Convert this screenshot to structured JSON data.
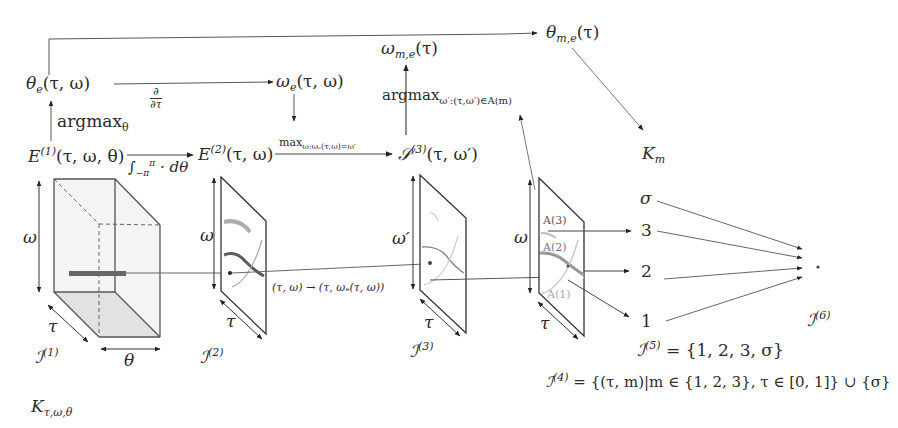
{
  "diagram": {
    "nodes": {
      "theta_e": "θ",
      "theta_e_sub": "e",
      "theta_e_args": "(τ, ω)",
      "omega_e": "ω",
      "omega_e_sub": "e",
      "omega_e_args": "(τ, ω)",
      "omega_me": "ω",
      "omega_me_sub": "m,e",
      "omega_me_args": "(τ)",
      "theta_me": "θ",
      "theta_me_sub": "m,e",
      "theta_me_args": "(τ)",
      "E1": "E",
      "E1_sup": "(1)",
      "E1_args": "(τ, ω, θ)",
      "E2": "E",
      "E2_sup": "(2)",
      "E2_args": "(τ, ω)",
      "S3": "𝒮",
      "S3_sup": "(3)",
      "S3_args": "(τ, ω′)",
      "K_m": "K",
      "K_m_sub": "m",
      "K_tow": "K",
      "K_tow_sub": "τ,ω,θ"
    },
    "edge_labels": {
      "argmax_theta": "argmax",
      "argmax_theta_sub": "θ",
      "d_dtau_num": "∂",
      "d_dtau_den": "∂τ",
      "integral": "∫",
      "integral_sup": "π",
      "integral_sub": "−π",
      "integral_body": "· dθ",
      "max_label": "max",
      "max_sub": "ω:ωₑ(τ,ω)=ω′",
      "argmax_omega": "argmax",
      "argmax_omega_sub": "ω′:(τ,ω′)∈A(m)",
      "mapping": "(τ, ω) → (τ, ωₑ(τ, ω))"
    },
    "axes": {
      "omega": "ω",
      "omega_prime": "ω′",
      "tau": "τ",
      "theta": "θ"
    },
    "regions": [
      "A(3)",
      "A(2)",
      "A(1)"
    ],
    "outputs": [
      "σ",
      "3",
      "2",
      "1"
    ],
    "spaces": {
      "I1": "ℐ",
      "I1_sup": "(1)",
      "I2": "ℐ",
      "I2_sup": "(2)",
      "I3": "ℐ",
      "I3_sup": "(3)",
      "I5": "ℐ",
      "I5_sup": "(5)",
      "I5_eq": " = {1, 2, 3, σ}",
      "I4": "ℐ",
      "I4_sup": "(4)",
      "I4_eq": " = {(τ, m)|m ∈ {1, 2, 3}, τ ∈ [0, 1]} ∪ {σ}",
      "I6": "ℐ",
      "I6_sup": "(6)"
    },
    "colors": {
      "line": "#333333",
      "light_line": "#888888",
      "cube_fill": "#ececec",
      "bar": "#666666"
    }
  }
}
